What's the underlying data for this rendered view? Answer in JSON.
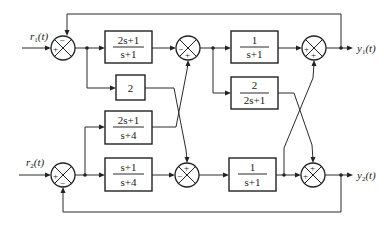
{
  "diagram": {
    "type": "block-diagram",
    "inputs": [
      {
        "id": "r1",
        "label": "r",
        "sub": "1",
        "arg": "(t)"
      },
      {
        "id": "r2",
        "label": "r",
        "sub": "2",
        "arg": "(t)"
      }
    ],
    "outputs": [
      {
        "id": "y1",
        "label": "y",
        "sub": "1",
        "arg": "(t)"
      },
      {
        "id": "y2",
        "label": "y",
        "sub": "2",
        "arg": "(t)"
      }
    ],
    "blocks": [
      {
        "id": "G1",
        "num": "2s+1",
        "den": "s+1"
      },
      {
        "id": "K",
        "num": "2",
        "den": ""
      },
      {
        "id": "G3",
        "num": "2s+1",
        "den": "s+4"
      },
      {
        "id": "G4",
        "num": "s+1",
        "den": "s+4"
      },
      {
        "id": "G5",
        "num": "1",
        "den": "s+1"
      },
      {
        "id": "G6",
        "num": "2",
        "den": "2s+1"
      },
      {
        "id": "G7",
        "num": "1",
        "den": "s+1"
      }
    ],
    "summing_junctions": [
      {
        "id": "S1",
        "signs": {
          "top": "−",
          "left": "+"
        }
      },
      {
        "id": "S2",
        "signs": {
          "left": "−",
          "bottom": "+"
        }
      },
      {
        "id": "S3",
        "signs": {
          "left": "+",
          "bottom": "+"
        }
      },
      {
        "id": "S4",
        "signs": {
          "left": "+",
          "bottom": "−"
        }
      },
      {
        "id": "S5",
        "signs": {
          "top": "+",
          "left": "−"
        }
      },
      {
        "id": "S6",
        "signs": {
          "top": "+",
          "left": "+"
        }
      }
    ],
    "connections": [
      "r1 -> S1(+)",
      "y1 -> S1(−) feedback",
      "S1 -> G1 -> S2(−)",
      "S1 -> K -> S5(+)",
      "r2 -> S4(+)",
      "y2 -> S4(−) feedback",
      "S4 -> G3 -> S2(+)",
      "S4 -> G4 -> S5(−)",
      "S2 -> G5 -> S3(+)",
      "S2 -> G6 -> S6(+)",
      "S5 -> G7 -> S6(+)",
      "G7 out -> S3(+)",
      "S3 -> y1",
      "S6 -> y2"
    ]
  }
}
